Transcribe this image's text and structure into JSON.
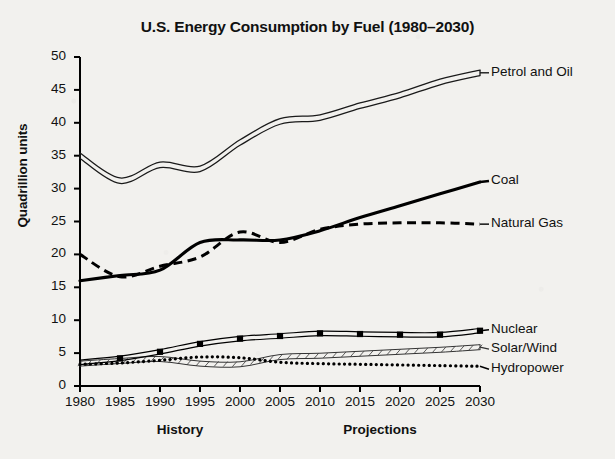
{
  "chart_data": {
    "type": "line",
    "title": "U.S. Energy Consumption by Fuel (1980–2030)",
    "xlabel": "",
    "ylabel": "Quadrillion units",
    "xlim": [
      1980,
      2030
    ],
    "ylim": [
      0,
      50
    ],
    "grid": false,
    "legend_position": "right-inline-labels",
    "x": [
      1980,
      1985,
      1990,
      1995,
      2000,
      2005,
      2010,
      2015,
      2020,
      2025,
      2030
    ],
    "x_tick_labels": [
      "1980",
      "1985",
      "1990",
      "1995",
      "2000",
      "2005",
      "2010",
      "2015",
      "2020",
      "2025",
      "2030"
    ],
    "y_tick_labels": [
      "0",
      "5",
      "10",
      "15",
      "20",
      "25",
      "30",
      "35",
      "40",
      "45",
      "50"
    ],
    "y_ticks": [
      0,
      5,
      10,
      15,
      20,
      25,
      30,
      35,
      40,
      45,
      50
    ],
    "annotations": [
      {
        "text": "History",
        "x": 1992.5,
        "position": "below-axis"
      },
      {
        "text": "Projections",
        "x": 2017.5,
        "position": "below-axis"
      }
    ],
    "series": [
      {
        "name": "Petrol and Oil",
        "style": "double-line",
        "color": "#1a1a1a",
        "values": [
          35.0,
          31.2,
          33.6,
          33.0,
          37.0,
          40.2,
          40.8,
          42.6,
          44.2,
          46.2,
          47.6
        ]
      },
      {
        "name": "Coal",
        "style": "thick-solid",
        "color": "#000000",
        "values": [
          16.0,
          16.8,
          17.6,
          21.8,
          22.2,
          22.2,
          23.6,
          25.6,
          27.4,
          29.2,
          31.0
        ]
      },
      {
        "name": "Natural Gas",
        "style": "dashed",
        "color": "#000000",
        "values": [
          20.0,
          16.6,
          18.2,
          19.6,
          23.4,
          21.8,
          23.8,
          24.6,
          24.8,
          24.8,
          24.6
        ]
      },
      {
        "name": "Nuclear",
        "style": "line-with-square-markers",
        "color": "#000000",
        "values": [
          3.6,
          4.2,
          5.2,
          6.4,
          7.2,
          7.6,
          8.0,
          7.9,
          7.8,
          7.8,
          8.4
        ]
      },
      {
        "name": "Solar/Wind",
        "style": "thin-double-line",
        "color": "#333333",
        "values": [
          3.4,
          3.8,
          4.1,
          3.4,
          3.3,
          4.4,
          4.6,
          4.9,
          5.2,
          5.5,
          5.9
        ]
      },
      {
        "name": "Hydropower",
        "style": "dotted",
        "color": "#000000",
        "values": [
          3.3,
          3.5,
          3.9,
          4.4,
          4.3,
          3.6,
          3.4,
          3.3,
          3.2,
          3.1,
          3.0
        ]
      }
    ]
  }
}
